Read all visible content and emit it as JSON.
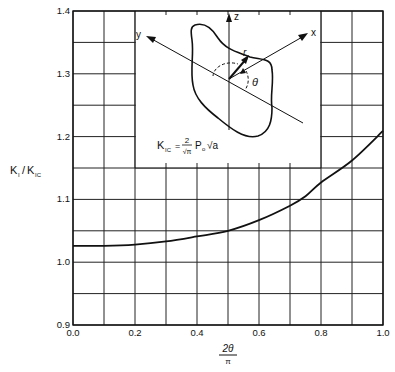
{
  "chart_data": {
    "type": "line",
    "title": "",
    "xlabel": "2θ/π",
    "xlabel_num": "2θ",
    "xlabel_den": "π",
    "ylabel": "K_I/K_IC",
    "ylabel_main": "K",
    "ylabel_sub1": "I",
    "ylabel_sub2": "IC",
    "xlim": [
      0.0,
      1.0
    ],
    "ylim": [
      0.9,
      1.4
    ],
    "grid": true,
    "x_ticks": [
      0.0,
      0.2,
      0.4,
      0.6,
      0.8,
      1.0
    ],
    "x_tick_labels": [
      "0.0",
      "0.2",
      "0.4",
      "0.6",
      "0.8",
      "1.0"
    ],
    "y_ticks": [
      0.9,
      1.0,
      1.1,
      1.2,
      1.3,
      1.4
    ],
    "y_tick_labels": [
      "0.9",
      "1.0",
      "1.1",
      "1.2",
      "1.3",
      "1.4"
    ],
    "series": [
      {
        "name": "K_I/K_IC",
        "x": [
          0.0,
          0.1,
          0.2,
          0.3,
          0.4,
          0.5,
          0.6,
          0.7,
          0.75,
          0.8,
          0.9,
          1.0
        ],
        "y": [
          1.026,
          1.026,
          1.028,
          1.033,
          1.041,
          1.05,
          1.067,
          1.09,
          1.105,
          1.127,
          1.162,
          1.209
        ]
      }
    ],
    "annotations": {
      "formula": "K_IC = (2/√π) P_o √a",
      "inset_axes": [
        "z",
        "x",
        "y"
      ],
      "inset_symbols": [
        "r",
        "θ"
      ]
    }
  },
  "labels": {
    "axis_z": "z",
    "axis_x": "x",
    "axis_y": "y",
    "sym_r": "r",
    "sym_theta": "θ",
    "formula_lhs": "K",
    "formula_lhs_sub": "IC",
    "formula_eq": "=",
    "formula_num": "2",
    "formula_den": "√π",
    "formula_p": "P",
    "formula_p_sub": "o",
    "formula_sqrt": "√a"
  },
  "colors": {
    "line": "#111111",
    "grid": "#222222",
    "background": "#ffffff"
  }
}
